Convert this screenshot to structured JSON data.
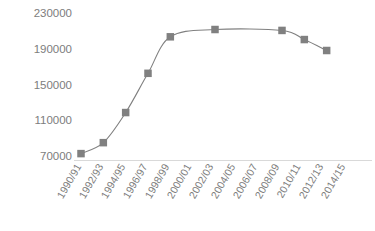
{
  "chart_data": {
    "type": "line",
    "title": "",
    "xlabel": "",
    "ylabel": "",
    "categories": [
      "1990/91",
      "1992/93",
      "1994/95",
      "1996/97",
      "1998/99",
      "2000/01",
      "2002/03",
      "2004/05",
      "2006/07",
      "2008/09",
      "2010/11",
      "2012/13",
      "2014/15"
    ],
    "series": [
      {
        "name": "",
        "x": [
          "1990/91",
          "1992/93",
          "1994/95",
          "1996/97",
          "1998/99",
          "2002/03",
          "2008/09",
          "2010/11",
          "2012/13"
        ],
        "values": [
          77000,
          89000,
          122000,
          165000,
          205000,
          213000,
          212000,
          202000,
          190000
        ]
      }
    ],
    "yticks": [
      230000,
      190000,
      150000,
      110000,
      70000
    ],
    "ytick_labels": [
      "230000",
      "190000",
      "150000",
      "110000",
      "70000"
    ],
    "ylim": [
      70000,
      230000
    ],
    "grid": false,
    "legend": "none",
    "line_color": "#808080",
    "marker_color": "#808080",
    "marker_shape": "square",
    "axis_color": "#d9d9d9"
  },
  "axes": {
    "y_ticks": [
      {
        "label": "230000",
        "value": 230000
      },
      {
        "label": "190000",
        "value": 190000
      },
      {
        "label": "150000",
        "value": 150000
      },
      {
        "label": "110000",
        "value": 110000
      },
      {
        "label": "70000",
        "value": 70000
      }
    ],
    "x_ticks": [
      {
        "label": "1990/91"
      },
      {
        "label": "1992/93"
      },
      {
        "label": "1994/95"
      },
      {
        "label": "1996/97"
      },
      {
        "label": "1998/99"
      },
      {
        "label": "2000/01"
      },
      {
        "label": "2002/03"
      },
      {
        "label": "2004/05"
      },
      {
        "label": "2006/07"
      },
      {
        "label": "2008/09"
      },
      {
        "label": "2010/11"
      },
      {
        "label": "2012/13"
      },
      {
        "label": "2014/15"
      }
    ]
  }
}
